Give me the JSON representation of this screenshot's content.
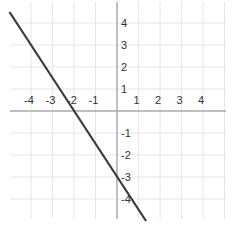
{
  "chart_data": {
    "type": "line",
    "title": "",
    "xlabel": "",
    "ylabel": "",
    "xlim": [
      -5.4,
      5.3
    ],
    "ylim": [
      -5.5,
      5.0
    ],
    "grid": true,
    "x_ticks": [
      -4,
      -3,
      -2,
      -1,
      1,
      2,
      3,
      4
    ],
    "y_ticks": [
      4,
      3,
      2,
      1,
      -1,
      -2,
      -3,
      -4
    ],
    "x_tick_labels": [
      "-4",
      "-3",
      "-2",
      "-1",
      "1",
      "2",
      "3",
      "4"
    ],
    "y_tick_labels": [
      "4",
      "3",
      "2",
      "1",
      "-1",
      "-2",
      "-3",
      "-4"
    ],
    "series": [
      {
        "name": "line",
        "equation": "y = -1.5x - 3",
        "slope": -1.5,
        "intercept": -3,
        "x": [
          -5,
          1.35
        ],
        "y": [
          4.5,
          -5.0
        ],
        "color": "#3a3a3a"
      }
    ],
    "legend": null
  },
  "colors": {
    "grid": "#e6e6e6",
    "axis": "#aaaaaa",
    "line": "#3a3a3a",
    "text": "#333333"
  }
}
